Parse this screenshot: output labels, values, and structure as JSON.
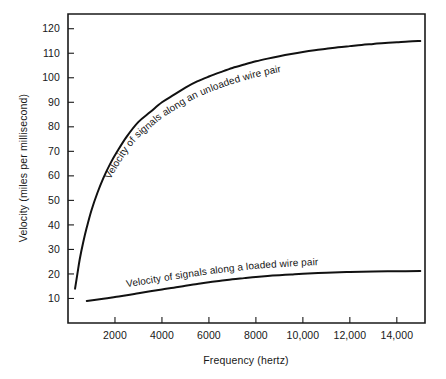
{
  "chart_data": {
    "type": "line",
    "title": "",
    "xlabel": "Frequency (hertz)",
    "ylabel": "Velocity (miles per millisecond)",
    "xlim": [
      0,
      15200
    ],
    "ylim": [
      0,
      126
    ],
    "grid": false,
    "legend_position": "inline-curve-labels",
    "x_ticks": [
      2000,
      4000,
      6000,
      8000,
      10000,
      12000,
      14000
    ],
    "x_tick_labels": [
      "2000",
      "4000",
      "6000",
      "8000",
      "10,000",
      "12,000",
      "14,000"
    ],
    "y_ticks": [
      10,
      20,
      30,
      40,
      50,
      60,
      70,
      80,
      90,
      100,
      110,
      120
    ],
    "y_tick_labels": [
      "10",
      "20",
      "30",
      "40",
      "50",
      "60",
      "70",
      "80",
      "90",
      "100",
      "110",
      "120"
    ],
    "series": [
      {
        "name": "Velocity of signals along an unloaded wire pair",
        "label_text": "Velocity of signals along an unloaded wire pair",
        "color": "#111111",
        "x": [
          300,
          400,
          500,
          650,
          800,
          1000,
          1250,
          1500,
          1800,
          2100,
          2500,
          3000,
          3500,
          4000,
          4500,
          5000,
          5500,
          6000,
          6500,
          7000,
          7500,
          8000,
          8500,
          9000,
          9500,
          10000,
          10500,
          11000,
          11500,
          12000,
          12500,
          13000,
          13500,
          14000,
          14500,
          15000
        ],
        "values": [
          14,
          20,
          26,
          33,
          39,
          46,
          53,
          59,
          65,
          70,
          76,
          82,
          86,
          90,
          93,
          96,
          98.5,
          100.5,
          102.3,
          104,
          105.4,
          106.7,
          107.8,
          108.8,
          109.7,
          110.5,
          111.2,
          111.8,
          112.4,
          112.9,
          113.4,
          113.8,
          114.2,
          114.5,
          114.8,
          115
        ]
      },
      {
        "name": "Velocity of signals along a loaded wire pair",
        "label_text": "Velocity of signals along a loaded wire pair",
        "color": "#111111",
        "x": [
          800,
          1500,
          2000,
          2500,
          3000,
          3500,
          4000,
          4500,
          5000,
          5500,
          6000,
          6500,
          7000,
          7500,
          8000,
          8500,
          9000,
          9500,
          10000,
          11000,
          12000,
          13000,
          14000,
          15000
        ],
        "values": [
          9.0,
          9.9,
          10.6,
          11.3,
          12.1,
          12.9,
          13.7,
          14.4,
          15.2,
          15.9,
          16.6,
          17.2,
          17.8,
          18.3,
          18.8,
          19.2,
          19.5,
          19.8,
          20.1,
          20.5,
          20.8,
          21.0,
          21.1,
          21.2
        ]
      }
    ]
  },
  "figure": {
    "background_color": "#ffffff",
    "axis_color": "#1a1a1a",
    "curve_color": "#111111"
  }
}
